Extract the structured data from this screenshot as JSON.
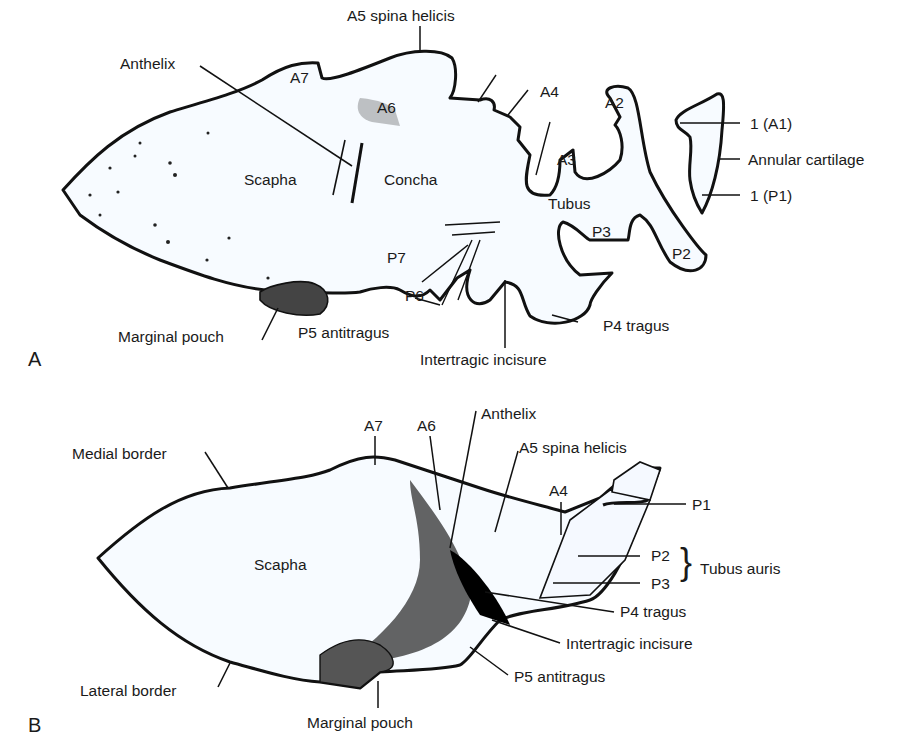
{
  "panel_a": {
    "letter": "A",
    "labels": {
      "a5": "A5 spina helicis",
      "anthelix": "Anthelix",
      "a7": "A7",
      "a6": "A6",
      "a4": "A4",
      "a2": "A2",
      "a3": "A3",
      "a1": "1 (A1)",
      "annular": "Annular cartilage",
      "p1": "1 (P1)",
      "scapha": "Scapha",
      "concha": "Concha",
      "tubus": "Tubus",
      "p3": "P3",
      "p2": "P2",
      "p7": "P7",
      "p6": "P6",
      "marginal_pouch": "Marginal pouch",
      "p5": "P5 antitragus",
      "p4": "P4 tragus",
      "intertragic": "Intertragic incisure"
    }
  },
  "panel_b": {
    "letter": "B",
    "labels": {
      "a7": "A7",
      "a6": "A6",
      "anthelix": "Anthelix",
      "medial_border": "Medial border",
      "a5": "A5 spina helicis",
      "a4": "A4",
      "p1": "P1",
      "scapha": "Scapha",
      "p2": "P2",
      "p3": "P3",
      "tubus_auris": "Tubus auris",
      "brace": "}",
      "p4": "P4 tragus",
      "intertragic": "Intertragic incisure",
      "p5": "P5 antitragus",
      "lateral_border": "Lateral border",
      "marginal_pouch": "Marginal pouch"
    }
  }
}
